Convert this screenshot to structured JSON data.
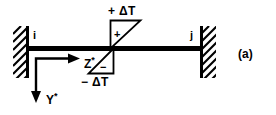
{
  "figure": {
    "caption": "(a)",
    "nodes": {
      "left_label": "i",
      "right_label": "j"
    },
    "temperature": {
      "top_label": "+ ΔT",
      "bottom_label": "− ΔT",
      "top_sign": "+",
      "bottom_sign": "−"
    },
    "axes": {
      "horizontal_label": "Z",
      "horizontal_star": "*",
      "vertical_label": "Y",
      "vertical_star": "*"
    },
    "colors": {
      "ink": "#000000",
      "background": "#ffffff"
    },
    "icons": {
      "left_support": "fixed-support-hatching",
      "right_support": "fixed-support-hatching",
      "beam": "beam-member",
      "z_arrow": "arrow-right",
      "y_arrow": "arrow-down",
      "top_gradient": "triangle-positive",
      "bottom_gradient": "triangle-negative"
    }
  }
}
